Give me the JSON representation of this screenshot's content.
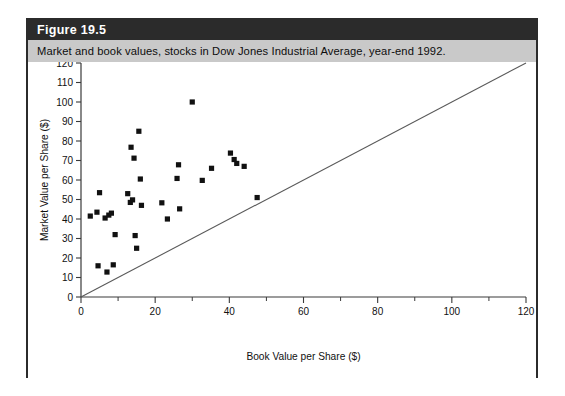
{
  "figure": {
    "number_label": "Figure 19.5",
    "caption": "Market and book values, stocks in Dow Jones Industrial Average, year-end 1992."
  },
  "chart_data": {
    "type": "scatter",
    "title": "Market and book values, stocks in Dow Jones Industrial Average, year-end 1992.",
    "xlabel": "Book Value per Share ($)",
    "ylabel": "Market Value per Share ($)",
    "xlim": [
      0,
      120
    ],
    "ylim": [
      0,
      120
    ],
    "xticks": [
      0,
      20,
      40,
      60,
      80,
      100,
      120
    ],
    "xticklabels": [
      "0",
      "20",
      "40",
      "60",
      "80",
      "100",
      "120"
    ],
    "x_minor_ticks": [
      10,
      30,
      50,
      70,
      90,
      110
    ],
    "yticks": [
      0,
      10,
      20,
      30,
      40,
      50,
      60,
      70,
      80,
      90,
      100,
      110,
      120
    ],
    "yticklabels": [
      "0",
      "10",
      "20",
      "30",
      "40",
      "50",
      "60",
      "70",
      "80",
      "90",
      "100",
      "110",
      "120"
    ],
    "grid": false,
    "legend": null,
    "reference_line": {
      "name": "45-degree line (market value = book value)",
      "from": [
        0,
        0
      ],
      "to": [
        120,
        120
      ]
    },
    "series": [
      {
        "name": "Dow Jones Industrial Average stocks",
        "marker": "filled-square",
        "color": "#111111",
        "points": [
          [
            2.5,
            41.5
          ],
          [
            4.3,
            43.5
          ],
          [
            4.6,
            16.0
          ],
          [
            5.0,
            53.5
          ],
          [
            6.5,
            40.5
          ],
          [
            7.0,
            12.8
          ],
          [
            7.5,
            42.0
          ],
          [
            8.2,
            43.0
          ],
          [
            8.7,
            16.5
          ],
          [
            9.2,
            32.0
          ],
          [
            12.6,
            53.0
          ],
          [
            13.3,
            48.5
          ],
          [
            13.5,
            76.8
          ],
          [
            13.9,
            49.8
          ],
          [
            14.3,
            71.2
          ],
          [
            14.6,
            31.5
          ],
          [
            15.0,
            25.0
          ],
          [
            15.6,
            85.0
          ],
          [
            16.0,
            60.5
          ],
          [
            16.3,
            47.0
          ],
          [
            21.8,
            48.3
          ],
          [
            23.3,
            40.0
          ],
          [
            25.9,
            60.8
          ],
          [
            26.3,
            67.8
          ],
          [
            26.6,
            45.2
          ],
          [
            30.0,
            100.0
          ],
          [
            32.7,
            59.8
          ],
          [
            35.2,
            66.0
          ],
          [
            40.3,
            73.8
          ],
          [
            41.3,
            70.5
          ],
          [
            42.0,
            68.5
          ],
          [
            44.0,
            67.0
          ],
          [
            47.5,
            51.0
          ]
        ]
      }
    ]
  }
}
